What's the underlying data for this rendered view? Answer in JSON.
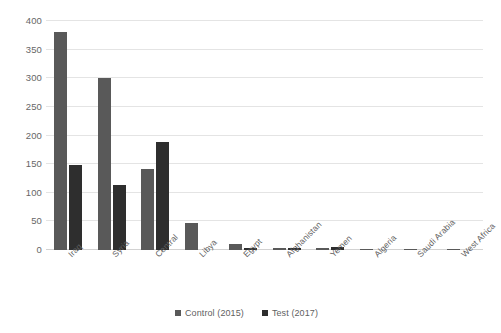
{
  "chart_data": {
    "type": "bar",
    "title": "",
    "subtitle": "",
    "xlabel": "",
    "ylabel": "",
    "ylim": [
      0,
      400
    ],
    "yticks": [
      0,
      50,
      100,
      150,
      200,
      250,
      300,
      350,
      400
    ],
    "ytick_labels": [
      "0",
      "50",
      "100",
      "150",
      "200",
      "250",
      "300",
      "350",
      "400"
    ],
    "grid": "horizontal",
    "legend_position": "bottom-center",
    "categories": [
      "Iraq",
      "Syria",
      "Central",
      "Libya",
      "Egypt",
      "Afghanistan",
      "Yemen",
      "Algeria",
      "Saudi Arabia",
      "West Africa"
    ],
    "series": [
      {
        "name": "Control (2015)",
        "color": "#595959",
        "values": [
          381,
          301,
          142,
          47,
          11,
          4,
          4,
          2,
          2,
          2
        ]
      },
      {
        "name": "Test (2017)",
        "color": "#2e2e2e",
        "values": [
          149,
          114,
          189,
          0,
          4,
          4,
          6,
          0,
          0,
          0
        ]
      }
    ]
  },
  "legend": {
    "items": [
      {
        "label": "Control (2015)",
        "color": "#595959"
      },
      {
        "label": "Test (2017)",
        "color": "#2e2e2e"
      }
    ]
  },
  "colors": {
    "background": "#ffffff",
    "gridline": "#e4e4e4",
    "axis": "#d2d2d2",
    "text": "#5f5f5f",
    "series_control": "#595959",
    "series_test": "#2e2e2e"
  }
}
